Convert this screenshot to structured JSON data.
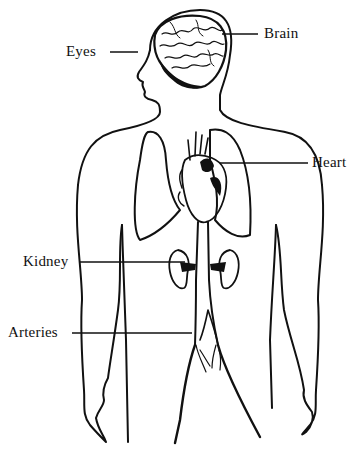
{
  "diagram": {
    "type": "anatomical-illustration",
    "colors": {
      "ink": "#111111",
      "background": "#ffffff"
    },
    "labels": [
      {
        "id": "brain",
        "text": "Brain"
      },
      {
        "id": "eyes",
        "text": "Eyes"
      },
      {
        "id": "heart",
        "text": "Heart"
      },
      {
        "id": "kidney",
        "text": "Kidney"
      },
      {
        "id": "arteries",
        "text": "Arteries"
      }
    ]
  }
}
